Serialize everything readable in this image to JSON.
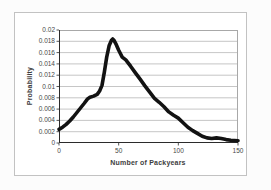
{
  "window": {
    "background_color": "#fcfcfc",
    "frame_border_color": "#c2c2c2"
  },
  "chart_style": {
    "plot_background": "#ffffff",
    "plot_border_color": "#a8a8a8",
    "axis_line_color": "#2b2b2b",
    "gridline_color": "#b8b8b8",
    "tick_text_color": "#474747",
    "title_text_color": "#3d3d3d"
  },
  "chart_data": {
    "type": "line",
    "title": "",
    "xlabel": "Number of Packyears",
    "ylabel": "Probability",
    "xlim": [
      0,
      150
    ],
    "ylim": [
      0,
      0.02
    ],
    "grid": "horizontal-only",
    "legend": "none",
    "x_ticks": [
      {
        "value": 0,
        "label": "0"
      },
      {
        "value": 50,
        "label": "50"
      },
      {
        "value": 100,
        "label": "100"
      },
      {
        "value": 150,
        "label": "150"
      }
    ],
    "y_ticks": [
      {
        "value": 0,
        "label": "0"
      },
      {
        "value": 0.002,
        "label": "0.002"
      },
      {
        "value": 0.004,
        "label": "0.004"
      },
      {
        "value": 0.006,
        "label": "0.006"
      },
      {
        "value": 0.008,
        "label": "0.008"
      },
      {
        "value": 0.01,
        "label": "0.01"
      },
      {
        "value": 0.012,
        "label": "0.012"
      },
      {
        "value": 0.014,
        "label": "0.014"
      },
      {
        "value": 0.016,
        "label": "0.016"
      },
      {
        "value": 0.018,
        "label": "0.018"
      },
      {
        "value": 0.02,
        "label": "0.02"
      }
    ],
    "series": [
      {
        "name": "probability-density",
        "color": "#121212",
        "stroke_width": 3.6,
        "points": [
          [
            0,
            0.0024
          ],
          [
            3,
            0.0028
          ],
          [
            6,
            0.0033
          ],
          [
            9,
            0.0039
          ],
          [
            12,
            0.0046
          ],
          [
            15,
            0.0054
          ],
          [
            18,
            0.0062
          ],
          [
            21,
            0.007
          ],
          [
            24,
            0.0078
          ],
          [
            26,
            0.0081
          ],
          [
            29,
            0.0083
          ],
          [
            32,
            0.0086
          ],
          [
            34,
            0.0092
          ],
          [
            36,
            0.0102
          ],
          [
            38,
            0.0125
          ],
          [
            40,
            0.0152
          ],
          [
            42,
            0.0172
          ],
          [
            44,
            0.0182
          ],
          [
            45,
            0.0184
          ],
          [
            46,
            0.0182
          ],
          [
            48,
            0.0174
          ],
          [
            50,
            0.0164
          ],
          [
            53,
            0.0152
          ],
          [
            56,
            0.0147
          ],
          [
            60,
            0.0136
          ],
          [
            64,
            0.0124
          ],
          [
            68,
            0.0113
          ],
          [
            72,
            0.0101
          ],
          [
            76,
            0.009
          ],
          [
            80,
            0.0079
          ],
          [
            84,
            0.0072
          ],
          [
            88,
            0.0064
          ],
          [
            92,
            0.0055
          ],
          [
            96,
            0.0049
          ],
          [
            100,
            0.0044
          ],
          [
            104,
            0.0036
          ],
          [
            108,
            0.0028
          ],
          [
            112,
            0.0022
          ],
          [
            116,
            0.0017
          ],
          [
            120,
            0.0012
          ],
          [
            124,
            0.0009
          ],
          [
            128,
            0.0008
          ],
          [
            132,
            0.0009
          ],
          [
            136,
            0.0008
          ],
          [
            140,
            0.0006
          ],
          [
            144,
            0.0005
          ],
          [
            150,
            0.0004
          ]
        ]
      }
    ]
  }
}
